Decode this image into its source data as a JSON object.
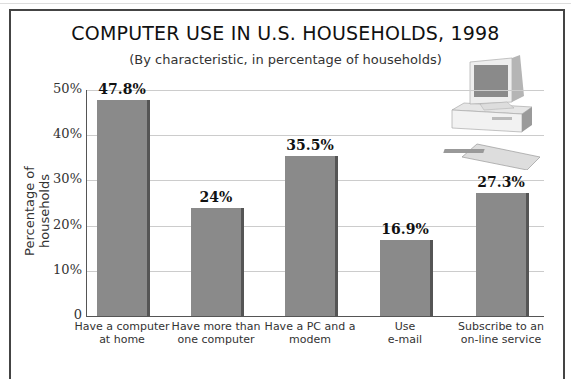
{
  "chart_data": {
    "type": "bar",
    "title": "COMPUTER USE IN U.S. HOUSEHOLDS, 1998",
    "subtitle": "(By characteristic, in percentage of households)",
    "xlabel": "",
    "ylabel": "Percentage of households",
    "ylim": [
      0,
      50
    ],
    "yticks": [
      "0",
      "10%",
      "20%",
      "30%",
      "40%",
      "50%"
    ],
    "grid": true,
    "categories": [
      "Have a computer at home",
      "Have more than one computer",
      "Have a PC and a modem",
      "Use e-mail",
      "Subscribe to an on-line service"
    ],
    "category_lines": [
      [
        "Have a computer",
        "at home"
      ],
      [
        "Have more than",
        "one computer"
      ],
      [
        "Have a PC and a",
        "modem"
      ],
      [
        "Use",
        "e-mail"
      ],
      [
        "Subscribe to an",
        "on-line service"
      ]
    ],
    "values": [
      47.8,
      24,
      35.5,
      16.9,
      27.3
    ],
    "value_labels": [
      "47.8%",
      "24%",
      "35.5%",
      "16.9%",
      "27.3%"
    ],
    "bar_color": "#8a8a8a"
  },
  "illustration": "desktop-computer-icon"
}
